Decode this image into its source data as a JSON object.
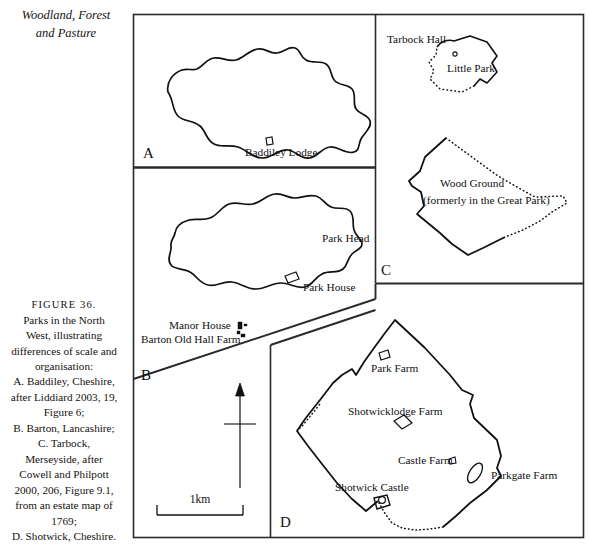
{
  "running_head": {
    "lines": [
      "Woodland, Forest",
      "and Pasture"
    ]
  },
  "caption": {
    "figure_number": "FIGURE 36.",
    "lines": [
      "Parks in the North",
      "West, illustrating",
      "differences of scale and",
      "organisation:",
      "A. Baddiley, Cheshire,",
      "after Liddiard 2003, 19,",
      "Figure 6;",
      "B. Barton, Lancashire;",
      "C. Tarbock,",
      "Merseyside, after",
      "Cowell and Philpott",
      "2000, 206, Figure 9.1,",
      "from an estate map of",
      "1769;",
      "D. Shotwick, Cheshire."
    ]
  },
  "panels": [
    {
      "id": "A",
      "letter": "A",
      "region": "Baddiley, Cheshire",
      "labels": [
        {
          "text": "Baddiley Lodge",
          "x": 245,
          "y": 153
        }
      ]
    },
    {
      "id": "B",
      "letter": "B",
      "region": "Barton, Lancashire",
      "labels": [
        {
          "text": "Park Head",
          "x": 322,
          "y": 239
        },
        {
          "text": "Park House",
          "x": 303,
          "y": 288
        },
        {
          "text": "Manor House",
          "x": 169,
          "y": 325
        },
        {
          "text": "Barton Old Hall Farm",
          "x": 141,
          "y": 339
        }
      ]
    },
    {
      "id": "C",
      "letter": "C",
      "region": "Tarbock, Merseyside",
      "labels": [
        {
          "text": "Tarbock Hall",
          "x": 387,
          "y": 40
        },
        {
          "text": "Little Park",
          "x": 447,
          "y": 69
        },
        {
          "text": "Wood Ground",
          "x": 440,
          "y": 183
        },
        {
          "text": "(formerly in the Great Park)",
          "x": 423,
          "y": 199
        }
      ]
    },
    {
      "id": "D",
      "letter": "D",
      "region": "Shotwick, Cheshire",
      "labels": [
        {
          "text": "Park Farm",
          "x": 371,
          "y": 368
        },
        {
          "text": "Shotwicklodge Farm",
          "x": 348,
          "y": 411
        },
        {
          "text": "Castle Farm",
          "x": 398,
          "y": 460
        },
        {
          "text": "Parkgate Farm",
          "x": 491,
          "y": 475
        },
        {
          "text": "Shotwick Castle",
          "x": 335,
          "y": 487
        }
      ]
    }
  ],
  "scale_bar": {
    "label": "1km"
  },
  "north_arrow": {
    "name": "north-arrow"
  },
  "colors": {
    "ink": "#111111",
    "paper": "#ffffff",
    "frame": "#2a2a2a"
  }
}
